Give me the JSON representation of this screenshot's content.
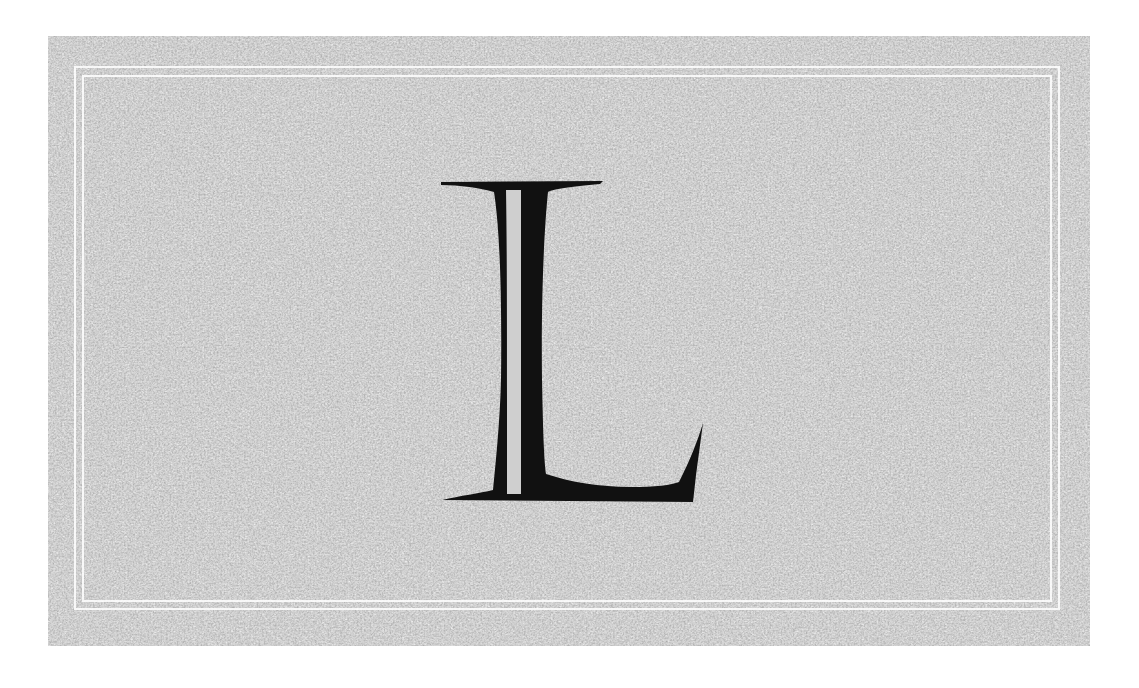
{
  "letter": {
    "character": "L",
    "fill_color": "#111111"
  },
  "background": {
    "texture_base_color": "#cdcdcd",
    "frame_line_color": "#ffffff",
    "page_color": "#ffffff"
  }
}
